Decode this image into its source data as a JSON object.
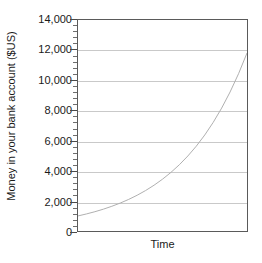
{
  "chart_data": {
    "type": "line",
    "title": "",
    "subtitle": "",
    "xlabel": "Time",
    "ylabel": "Money in your bank account ($US)",
    "ylim": [
      0,
      14000
    ],
    "xlim": [
      0,
      1
    ],
    "grid": true,
    "legend": false,
    "legend_position": "none",
    "y_ticks": [
      0,
      2000,
      4000,
      6000,
      8000,
      10000,
      12000,
      14000
    ],
    "y_tick_labels": [
      "0",
      "2,000",
      "4,000",
      "6,000",
      "8,000",
      "10,000",
      "12,000",
      "14,000"
    ],
    "y_minor_ticks_per_interval": 4,
    "x_ticks": [],
    "x_tick_labels": [],
    "series": [
      {
        "name": "Compound growth",
        "color": "#b0b0b0",
        "line_width": 1,
        "x": [
          0,
          0.05,
          0.1,
          0.15,
          0.2,
          0.25,
          0.3,
          0.35,
          0.4,
          0.45,
          0.5,
          0.55,
          0.6,
          0.65,
          0.7,
          0.75,
          0.8,
          0.85,
          0.9,
          0.95,
          1
        ],
        "values": [
          1000,
          1131,
          1280,
          1448,
          1639,
          1854,
          2097,
          2373,
          2685,
          3038,
          3437,
          3888,
          4399,
          4977,
          5630,
          6370,
          7207,
          8154,
          9225,
          10437,
          11808
        ]
      }
    ],
    "annotations": []
  },
  "axes": {
    "y_title": "Money in your bank account ($US)",
    "x_title": "Time"
  },
  "colors": {
    "curve": "#b0b0b0",
    "gridline": "#c9c9c9",
    "frame": "#5a5a5a",
    "text": "#1a1a1a",
    "background": "#ffffff"
  }
}
